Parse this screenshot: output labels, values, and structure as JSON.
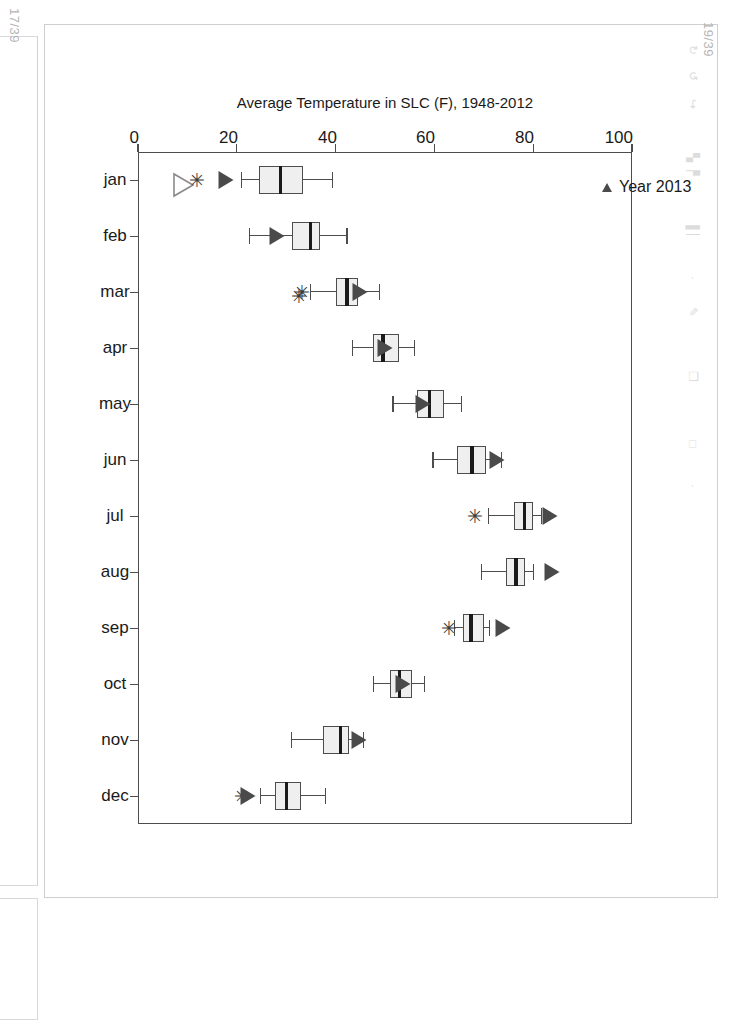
{
  "viewer": {
    "page_label_left": "17/39",
    "page_label_right": "19/39",
    "ghost_icons": [
      "redo-icon",
      "undo-icon",
      "signal-icon",
      "bars-icon",
      "copy-icon",
      "square-icon"
    ]
  },
  "chart_data": {
    "type": "boxplot",
    "title": "",
    "orientation": "rotated-90-clockwise",
    "xlabel": "",
    "ylabel": "Average Temperature in SLC (F), 1948-2012",
    "ylim": [
      0,
      100
    ],
    "yticks": [
      0,
      20,
      40,
      60,
      80,
      100
    ],
    "ytick_labels": [
      "0",
      "20",
      "40",
      "60",
      "80",
      "100"
    ],
    "grid": false,
    "categories": [
      "jan",
      "feb",
      "mar",
      "apr",
      "may",
      "jun",
      "jul",
      "aug",
      "sep",
      "oct",
      "nov",
      "dec"
    ],
    "legend": {
      "position": "top-left",
      "entries": [
        {
          "label": "Year 2013",
          "marker": "filled-triangle",
          "color": "#4a4a4a"
        }
      ]
    },
    "boxes": [
      {
        "category": "jan",
        "min": 20.9,
        "q1": 24.4,
        "median": 28.9,
        "q3": 33.4,
        "max": 39.3,
        "outliers": [
          11.7
        ],
        "marker_2013": 17.9
      },
      {
        "category": "feb",
        "min": 22.6,
        "q1": 31.2,
        "median": 35.0,
        "q3": 36.9,
        "max": 42.3,
        "outliers": [],
        "marker_2013": 28.1
      },
      {
        "category": "mar",
        "min": 34.9,
        "q1": 40.1,
        "median": 42.3,
        "q3": 44.6,
        "max": 48.9,
        "outliers": [
          33.0,
          32.4
        ],
        "marker_2013": 45.0
      },
      {
        "category": "apr",
        "min": 43.5,
        "q1": 47.5,
        "median": 49.6,
        "q3": 52.9,
        "max": 56.0,
        "outliers": [],
        "marker_2013": 49.9
      },
      {
        "category": "may",
        "min": 51.6,
        "q1": 56.4,
        "median": 59.0,
        "q3": 62.0,
        "max": 65.5,
        "outliers": [],
        "marker_2013": 57.6
      },
      {
        "category": "jun",
        "min": 59.7,
        "q1": 64.6,
        "median": 67.6,
        "q3": 70.5,
        "max": 73.5,
        "outliers": [],
        "marker_2013": 72.6
      },
      {
        "category": "jul",
        "min": 71.0,
        "q1": 76.1,
        "median": 78.2,
        "q3": 79.9,
        "max": 81.6,
        "outliers": [
          68.0
        ],
        "marker_2013": 83.5
      },
      {
        "category": "aug",
        "min": 69.5,
        "q1": 74.5,
        "median": 76.5,
        "q3": 78.4,
        "max": 80.0,
        "outliers": [],
        "marker_2013": 83.9
      },
      {
        "category": "sep",
        "min": 64.0,
        "q1": 65.8,
        "median": 67.4,
        "q3": 70.0,
        "max": 71.2,
        "outliers": [
          62.8
        ],
        "marker_2013": 73.8
      },
      {
        "category": "oct",
        "min": 47.7,
        "q1": 51.0,
        "median": 53.0,
        "q3": 55.5,
        "max": 57.9,
        "outliers": [],
        "marker_2013": 53.6
      },
      {
        "category": "nov",
        "min": 31.0,
        "q1": 37.5,
        "median": 41.0,
        "q3": 42.8,
        "max": 45.6,
        "outliers": [],
        "marker_2013": 44.8
      },
      {
        "category": "dec",
        "min": 24.8,
        "q1": 27.7,
        "median": 30.0,
        "q3": 33.0,
        "max": 37.9,
        "outliers": [
          20.9
        ],
        "marker_2013": 22.3
      }
    ]
  }
}
